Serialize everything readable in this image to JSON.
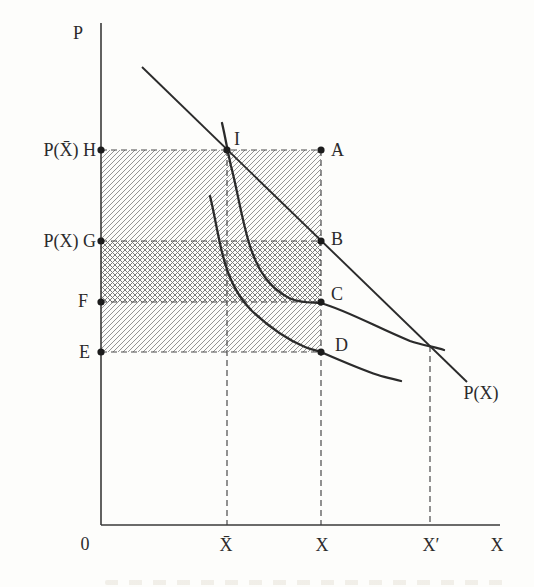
{
  "figure": {
    "axes": {
      "y_label": "P",
      "x_label": "X",
      "origin": "0"
    },
    "price_axis_labels": {
      "h": "P(X̄) H",
      "g": "P(X) G",
      "f": "F",
      "e": "E"
    },
    "point_labels": {
      "a": "A",
      "b": "B",
      "c": "C",
      "d": "D",
      "i": "I"
    },
    "quantity_axis_labels": {
      "xbar": "X̄",
      "x": "X",
      "xprime": "X′"
    },
    "demand_curve_label": "P(X)",
    "colors": {
      "ink": "#2b2b2b",
      "axis": "#3a3a3a",
      "dash": "#4a4a4a",
      "hatch": "#909090",
      "crosshatch": "#7d7d7d"
    }
  }
}
